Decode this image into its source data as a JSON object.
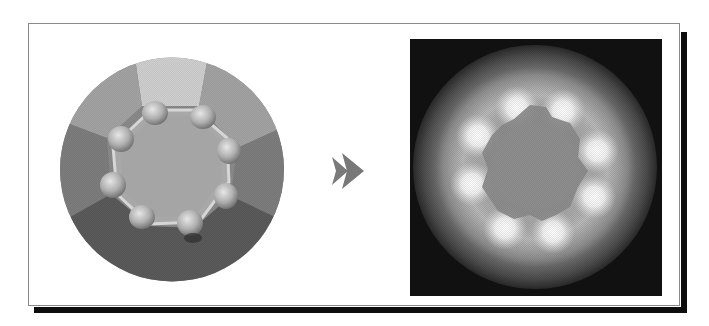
{
  "figure": {
    "left_panel": {
      "label": "Source disc",
      "facets": [
        "top-light",
        "upper-left",
        "upper-right",
        "left",
        "right",
        "bottom-dark"
      ],
      "bump_count": 8,
      "colors": {
        "top_facet": "#cfcfcf",
        "upper_facets": "#a3a3a3",
        "side_facets": "#7d7d7d",
        "bottom_facet": "#5a5a5a",
        "inner_octagon": "#a8a8a8",
        "bump": "#b8b8b8"
      }
    },
    "arrow": {
      "icon": "fast-forward-icon",
      "color": "#787878"
    },
    "right_panel": {
      "label": "Glow rendering",
      "glow_count": 8,
      "colors": {
        "background": "#111111",
        "outer_edge": "#3a3a3a",
        "mid_ring": "#a0a0a0",
        "inner_area": "#8c8c8c",
        "glow": "#ffffff"
      }
    },
    "frame": {
      "border_color": "#8a8a8a",
      "shadow_color": "#0d0d0d"
    }
  }
}
